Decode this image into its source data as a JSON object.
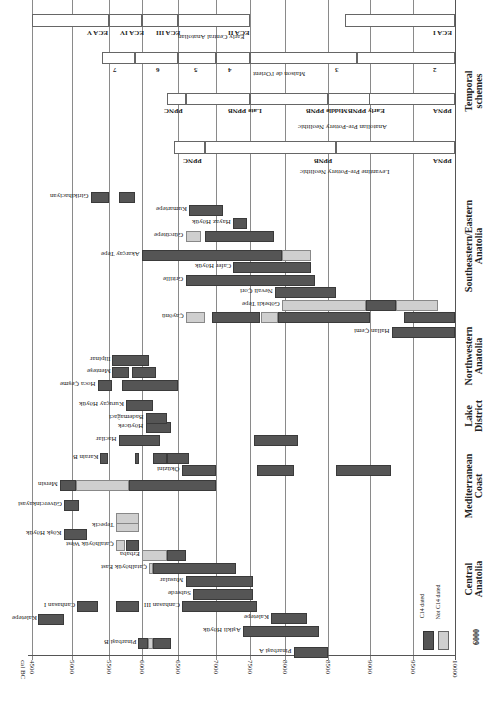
{
  "chart_data": {
    "type": "gantt-bar",
    "orientation_note": "figure rotated: time axis horizontal at bottom (cal BC), regions listed down the right side",
    "xlabel": "cal BC",
    "x_ticks": [
      4500,
      5000,
      5500,
      6000,
      6500,
      7000,
      7500,
      8000,
      8500,
      9000,
      9500,
      10000
    ],
    "xlim": [
      4500,
      10000
    ],
    "legend": [
      {
        "label": "C14 dated",
        "color": "#555555"
      },
      {
        "label": "Not C14 dated",
        "color": "#cfcfcf"
      }
    ],
    "regions": [
      {
        "name": "Central Anatolia",
        "sites": [
          {
            "name": "Pinarbaşi A",
            "segments": [
              {
                "from": 8100,
                "to": 8500,
                "c14": true
              }
            ]
          },
          {
            "name": "Pinarbaşi B",
            "segments": [
              {
                "from": 5940,
                "to": 6080,
                "c14": true
              },
              {
                "from": 6080,
                "to": 6150,
                "c14": false
              },
              {
                "from": 6150,
                "to": 6400,
                "c14": true
              }
            ]
          },
          {
            "name": "Aşikli Höyük",
            "segments": [
              {
                "from": 7400,
                "to": 8400,
                "c14": true
              }
            ]
          },
          {
            "name": "Kaletepe",
            "segments": [
              {
                "from": 7800,
                "to": 8250,
                "c14": true
              }
            ]
          },
          {
            "name": "Kaletepe",
            "segments": [
              {
                "from": 4580,
                "to": 4900,
                "c14": true
              }
            ]
          },
          {
            "name": "Canhasan III",
            "segments": [
              {
                "from": 6550,
                "to": 7600,
                "c14": true
              }
            ]
          },
          {
            "name": "Canhasan I",
            "segments": [
              {
                "from": 5070,
                "to": 5350,
                "c14": true
              },
              {
                "from": 5600,
                "to": 5950,
                "c14": true
              }
            ]
          },
          {
            "name": "Suberde",
            "segments": [
              {
                "from": 6700,
                "to": 7550,
                "c14": true
              }
            ]
          },
          {
            "name": "Musular",
            "segments": [
              {
                "from": 6600,
                "to": 7550,
                "c14": true
              }
            ]
          },
          {
            "name": "Çatalhöyük East",
            "segments": [
              {
                "from": 6100,
                "to": 6150,
                "c14": false
              },
              {
                "from": 6150,
                "to": 7300,
                "c14": true
              }
            ]
          },
          {
            "name": "Erbaba",
            "segments": [
              {
                "from": 6000,
                "to": 6350,
                "c14": false
              },
              {
                "from": 6350,
                "to": 6600,
                "c14": true
              }
            ]
          },
          {
            "name": "Çatalhöyük West",
            "segments": [
              {
                "from": 5600,
                "to": 5750,
                "c14": false
              },
              {
                "from": 5750,
                "to": 5950,
                "c14": true
              }
            ]
          },
          {
            "name": "Köşk Höyük",
            "segments": [
              {
                "from": 4900,
                "to": 5200,
                "c14": true
              }
            ]
          },
          {
            "name": "Tepecik",
            "segments": [
              {
                "from": 5600,
                "to": 5950,
                "c14": false
              }
            ]
          },
          {
            "name": "Tepecik (2)",
            "segments": [
              {
                "from": 5600,
                "to": 5950,
                "c14": false
              }
            ]
          },
          {
            "name": "Güvercinkayasi",
            "segments": [
              {
                "from": 4900,
                "to": 5100,
                "c14": true
              }
            ]
          }
        ]
      },
      {
        "name": "Mediterranean Coast",
        "sites": [
          {
            "name": "Mersin",
            "segments": [
              {
                "from": 4850,
                "to": 5050,
                "c14": true
              },
              {
                "from": 5050,
                "to": 5800,
                "c14": false
              },
              {
                "from": 5800,
                "to": 7000,
                "c14": true
              }
            ]
          },
          {
            "name": "Öküzini",
            "segments": [
              {
                "from": 6550,
                "to": 7000,
                "c14": true
              },
              {
                "from": 7600,
                "to": 8100,
                "c14": true
              },
              {
                "from": 8600,
                "to": 9250,
                "c14": true
              }
            ]
          },
          {
            "name": "Karain B",
            "segments": [
              {
                "from": 5380,
                "to": 5480,
                "c14": true
              },
              {
                "from": 5900,
                "to": 5950,
                "c14": true
              },
              {
                "from": 6150,
                "to": 6350,
                "c14": true
              },
              {
                "from": 6350,
                "to": 6650,
                "c14": true
              }
            ]
          }
        ]
      },
      {
        "name": "Lake District",
        "sites": [
          {
            "name": "Hacilar",
            "segments": [
              {
                "from": 5650,
                "to": 6250,
                "c14": true
              },
              {
                "from": 7550,
                "to": 8150,
                "c14": true
              }
            ]
          },
          {
            "name": "Höyücek",
            "segments": [
              {
                "from": 6050,
                "to": 6400,
                "c14": true
              }
            ]
          },
          {
            "name": "Bademağaci",
            "segments": [
              {
                "from": 6050,
                "to": 6350,
                "c14": true
              }
            ]
          },
          {
            "name": "Kuruçay Höyük",
            "segments": [
              {
                "from": 5750,
                "to": 6150,
                "c14": true
              }
            ]
          }
        ]
      },
      {
        "name": "Northwestern Anatolia",
        "sites": [
          {
            "name": "Hoca Çeşme",
            "segments": [
              {
                "from": 5350,
                "to": 5550,
                "c14": true
              },
              {
                "from": 5700,
                "to": 6500,
                "c14": true
              }
            ]
          },
          {
            "name": "Menteşe",
            "segments": [
              {
                "from": 5550,
                "to": 5800,
                "c14": true
              },
              {
                "from": 5850,
                "to": 6200,
                "c14": true
              }
            ]
          },
          {
            "name": "Ilipinar",
            "segments": [
              {
                "from": 5550,
                "to": 6100,
                "c14": true
              }
            ]
          }
        ]
      },
      {
        "name": "Southeastern/Eastern Anatolia",
        "sites": [
          {
            "name": "Hallan Çemi",
            "segments": [
              {
                "from": 9250,
                "to": 10000,
                "c14": true
              }
            ]
          },
          {
            "name": "Çayönü",
            "segments": [
              {
                "from": 6600,
                "to": 6850,
                "c14": false
              },
              {
                "from": 6950,
                "to": 7650,
                "c14": true
              },
              {
                "from": 7650,
                "to": 7900,
                "c14": false
              },
              {
                "from": 7900,
                "to": 9000,
                "c14": true
              },
              {
                "from": 9400,
                "to": 10000,
                "c14": true
              }
            ]
          },
          {
            "name": "Göbekli Tepe",
            "segments": [
              {
                "from": 7950,
                "to": 8950,
                "c14": false
              },
              {
                "from": 8950,
                "to": 9300,
                "c14": true
              },
              {
                "from": 9300,
                "to": 9800,
                "c14": false
              }
            ]
          },
          {
            "name": "Nevali Çori",
            "segments": [
              {
                "from": 7850,
                "to": 8600,
                "c14": true
              }
            ]
          },
          {
            "name": "Gritille",
            "segments": [
              {
                "from": 6600,
                "to": 8350,
                "c14": true
              }
            ]
          },
          {
            "name": "Cafer Höyük",
            "segments": [
              {
                "from": 7250,
                "to": 8300,
                "c14": true
              }
            ]
          },
          {
            "name": "Akarçay Tepe",
            "segments": [
              {
                "from": 6000,
                "to": 7950,
                "c14": true
              },
              {
                "from": 7950,
                "to": 8300,
                "c14": false
              }
            ]
          },
          {
            "name": "Girikihaciyan",
            "segments": [
              {
                "from": 5250,
                "to": 5500,
                "c14": true
              },
              {
                "from": 5650,
                "to": 5900,
                "c14": true
              }
            ]
          },
          {
            "name": "Kumartepe",
            "segments": [
              {
                "from": 6650,
                "to": 7100,
                "c14": true
              }
            ]
          },
          {
            "name": "Hayaz Höyük",
            "segments": [
              {
                "from": 7250,
                "to": 7450,
                "c14": true
              }
            ]
          },
          {
            "name": "Gürcütepe",
            "segments": [
              {
                "from": 6600,
                "to": 6800,
                "c14": false
              },
              {
                "from": 6850,
                "to": 7850,
                "c14": true
              }
            ]
          }
        ]
      }
    ],
    "temporal_schemes": [
      {
        "name": "Levantine Pre-Pottery Neolithic",
        "periods": [
          {
            "label": "PPNA",
            "from": 8600,
            "to": 10000
          },
          {
            "label": "PPNB",
            "from": 6850,
            "to": 8600
          },
          {
            "label": "PPNC",
            "from": 6450,
            "to": 6850
          }
        ]
      },
      {
        "name": "Anatolian Pre-Pottery Neolithic",
        "periods": [
          {
            "label": "PPNA",
            "from": 8500,
            "to": 10000
          },
          {
            "label": "Early PPNB",
            "from": 8500,
            "to": 9000
          },
          {
            "label": "Middle PPNB",
            "from": 7500,
            "to": 8500
          },
          {
            "label": "Late PPNB",
            "from": 6600,
            "to": 7500
          },
          {
            "label": "PPNC",
            "from": 6350,
            "to": 6600
          }
        ]
      },
      {
        "name": "Maison de l'Orient",
        "periods": [
          {
            "label": "2",
            "from": 8850,
            "to": 10000
          },
          {
            "label": "3",
            "from": 7500,
            "to": 8850
          },
          {
            "label": "4",
            "from": 7000,
            "to": 7500
          },
          {
            "label": "5",
            "from": 6500,
            "to": 7000
          },
          {
            "label": "6",
            "from": 5900,
            "to": 6500
          },
          {
            "label": "7",
            "from": 5400,
            "to": 5900
          }
        ]
      },
      {
        "name": "Early Central Anatolian",
        "periods": [
          {
            "label": "ECA I",
            "from": 8700,
            "to": 10000
          },
          {
            "label": "ECA II",
            "from": 6500,
            "to": 7500
          },
          {
            "label": "ECA III",
            "from": 6000,
            "to": 6500
          },
          {
            "label": "ECA IV",
            "from": 5500,
            "to": 6000
          },
          {
            "label": "ECA V",
            "from": 4500,
            "to": 5500
          }
        ]
      }
    ]
  },
  "labels": {
    "axis_title": "cal BC",
    "corner_year": "6000",
    "legend_c14": "C14 dated",
    "legend_not_c14": "Not C14 dated",
    "region_central": "Central Anatolia",
    "region_med": "Mediterranean Coast",
    "region_lake": "Lake District",
    "region_nw": "Northwestern Anatolia",
    "region_se": "Southeastern/Eastern Anatolia",
    "region_temporal": "Temporal schemes",
    "scheme_levantine": "Levantine Pre-Pottery Neolithic",
    "scheme_anatolian": "Anatolian Pre-Pottery Neolithic",
    "scheme_maison": "Maison de l'Orient",
    "scheme_eca": "Early Central Anatolian"
  }
}
